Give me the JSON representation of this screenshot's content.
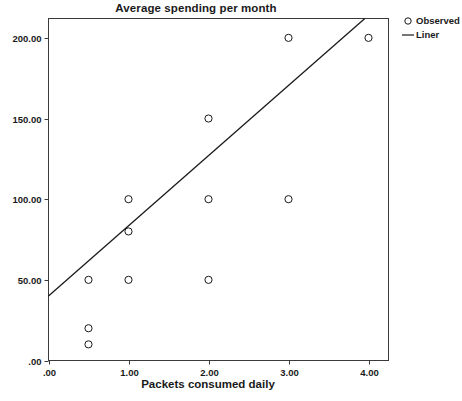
{
  "chart_data": {
    "type": "scatter",
    "title": "Average spending per month",
    "xlabel": "Packets consumed daily",
    "ylabel": "",
    "xlim": [
      0,
      4.25
    ],
    "ylim": [
      0,
      212
    ],
    "grid": false,
    "legend_position": "right",
    "x_tick_labels": [
      ".00",
      "1.00",
      "2.00",
      "3.00",
      "4.00"
    ],
    "x_tick_values": [
      0,
      1,
      2,
      3,
      4
    ],
    "y_tick_labels": [
      ".00",
      "50.00",
      "100.00",
      "150.00",
      "200.00"
    ],
    "y_tick_values": [
      0,
      50,
      100,
      150,
      200
    ],
    "series": [
      {
        "name": "Observed",
        "type": "scatter",
        "marker": "open-circle",
        "color": "#1a1a1a",
        "points": [
          {
            "x": 0.5,
            "y": 50
          },
          {
            "x": 0.5,
            "y": 20
          },
          {
            "x": 0.5,
            "y": 10
          },
          {
            "x": 1.0,
            "y": 100
          },
          {
            "x": 1.0,
            "y": 80
          },
          {
            "x": 1.0,
            "y": 50
          },
          {
            "x": 2.0,
            "y": 150
          },
          {
            "x": 2.0,
            "y": 100
          },
          {
            "x": 2.0,
            "y": 50
          },
          {
            "x": 3.0,
            "y": 200
          },
          {
            "x": 3.0,
            "y": 100
          },
          {
            "x": 4.0,
            "y": 200
          }
        ]
      },
      {
        "name": "Liner",
        "type": "line",
        "color": "#1a1a1a",
        "fit": {
          "intercept": 40,
          "slope": 43.5
        },
        "endpoints": [
          {
            "x": 0,
            "y": 40
          },
          {
            "x": 4.0,
            "y": 214
          }
        ]
      }
    ]
  },
  "legend": {
    "items": [
      {
        "label": "Observed",
        "key": "open-circle-marker"
      },
      {
        "label": "Liner",
        "key": "line-segment-marker"
      }
    ]
  }
}
